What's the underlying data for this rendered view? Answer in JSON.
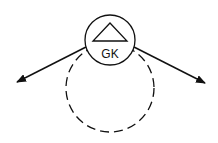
{
  "diagram": {
    "node": {
      "label": "GK",
      "symbol": "triangle"
    },
    "loop": {
      "style": "dashed"
    },
    "arrows": [
      {
        "direction": "lower-left"
      },
      {
        "direction": "lower-right"
      }
    ],
    "colors": {
      "stroke": "#111111",
      "background": "#ffffff"
    }
  }
}
